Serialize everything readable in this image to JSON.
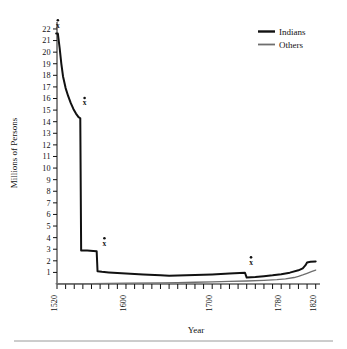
{
  "chart_data": {
    "type": "line",
    "title": "",
    "xlabel": "Year",
    "ylabel": "Millions of Persons",
    "xlim": [
      1520,
      1825
    ],
    "ylim": [
      0,
      22.6
    ],
    "grid": false,
    "legend_position": "top-right",
    "x_tick_labels": [
      "1520",
      "1600",
      "1700",
      "1780",
      "1820"
    ],
    "x_tick_values": [
      1520,
      1600,
      1700,
      1780,
      1820
    ],
    "x_minor_tick_step": 10,
    "y_tick_labels": [
      "22",
      "21",
      "20",
      "19",
      "18",
      "17",
      "16",
      "15",
      "14",
      "13",
      "12",
      "11",
      "10",
      "9",
      "8",
      "7",
      "6",
      "5",
      "4",
      "3",
      "2",
      "1"
    ],
    "y_tick_values": [
      22,
      21,
      20,
      19,
      18,
      17,
      16,
      15,
      14,
      13,
      12,
      11,
      10,
      9,
      8,
      7,
      6,
      5,
      4,
      3,
      2,
      1
    ],
    "series": [
      {
        "name": "Indians",
        "color": "#111111",
        "width": 2.0,
        "points": [
          [
            1519,
            21.6
          ],
          [
            1521,
            21.6
          ],
          [
            1523,
            20.4
          ],
          [
            1525,
            19.0
          ],
          [
            1527,
            17.9
          ],
          [
            1530,
            16.9
          ],
          [
            1533,
            16.2
          ],
          [
            1536,
            15.6
          ],
          [
            1539,
            15.1
          ],
          [
            1542,
            14.7
          ],
          [
            1545,
            14.4
          ],
          [
            1547,
            14.3
          ],
          [
            1548,
            2.9
          ],
          [
            1555,
            2.88
          ],
          [
            1562,
            2.85
          ],
          [
            1566,
            2.83
          ],
          [
            1567,
            1.1
          ],
          [
            1572,
            1.05
          ],
          [
            1580,
            1.0
          ],
          [
            1590,
            0.95
          ],
          [
            1600,
            0.9
          ],
          [
            1620,
            0.82
          ],
          [
            1640,
            0.75
          ],
          [
            1650,
            0.72
          ],
          [
            1660,
            0.73
          ],
          [
            1680,
            0.78
          ],
          [
            1700,
            0.83
          ],
          [
            1720,
            0.9
          ],
          [
            1738,
            0.97
          ],
          [
            1740,
            0.55
          ],
          [
            1750,
            0.6
          ],
          [
            1760,
            0.67
          ],
          [
            1770,
            0.75
          ],
          [
            1780,
            0.85
          ],
          [
            1790,
            0.98
          ],
          [
            1800,
            1.18
          ],
          [
            1805,
            1.35
          ],
          [
            1808,
            1.6
          ],
          [
            1810,
            1.85
          ],
          [
            1814,
            1.92
          ],
          [
            1820,
            1.95
          ]
        ]
      },
      {
        "name": "Others",
        "color": "#6e6e6e",
        "width": 1.3,
        "points": [
          [
            1519,
            0.02
          ],
          [
            1560,
            0.04
          ],
          [
            1600,
            0.07
          ],
          [
            1640,
            0.1
          ],
          [
            1660,
            0.12
          ],
          [
            1680,
            0.15
          ],
          [
            1700,
            0.18
          ],
          [
            1720,
            0.22
          ],
          [
            1740,
            0.26
          ],
          [
            1760,
            0.32
          ],
          [
            1775,
            0.38
          ],
          [
            1785,
            0.45
          ],
          [
            1795,
            0.56
          ],
          [
            1800,
            0.65
          ],
          [
            1805,
            0.78
          ],
          [
            1810,
            0.92
          ],
          [
            1815,
            1.06
          ],
          [
            1820,
            1.2
          ]
        ]
      }
    ],
    "annotations": [
      {
        "label": "x",
        "dot": true,
        "x": 1521,
        "y": 22.1
      },
      {
        "label": "x",
        "dot": true,
        "x": 1552,
        "y": 15.4
      },
      {
        "label": "x",
        "dot": true,
        "x": 1575,
        "y": 3.3
      },
      {
        "label": "x",
        "dot": true,
        "x": 1745,
        "y": 1.65
      }
    ]
  },
  "legend": {
    "items": [
      {
        "label": "Indians"
      },
      {
        "label": "Others"
      }
    ]
  },
  "axes": {
    "x_title": "Year",
    "y_title": "Millions of Persons"
  }
}
